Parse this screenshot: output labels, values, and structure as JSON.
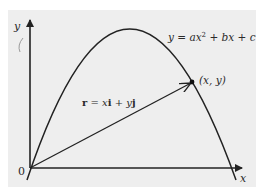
{
  "diagram": {
    "type": "position-vector-on-parabola",
    "background": {
      "panel": "#eeeeee",
      "page": "#ffffff"
    },
    "colors": {
      "stroke": "#222222",
      "text": "#2a2a2a",
      "stray_mark": "#9a9a9a"
    },
    "axes": {
      "x_label": "x",
      "y_label": "y",
      "origin_label": "0"
    },
    "curve": {
      "equation": "y = ax² + bx + c",
      "equation_parts": {
        "lhs": "y",
        "eq": " = ",
        "a": "a",
        "x1": "x",
        "sup": "2",
        "plus1": " + ",
        "b": "b",
        "x2": "x",
        "plus2": " + ",
        "c": "c"
      }
    },
    "point": {
      "label": "(x, y)"
    },
    "vector": {
      "label": "r = xi + yj",
      "label_parts": {
        "r": "r",
        "eq": " = ",
        "x": "x",
        "i": "i",
        "plus": " + ",
        "y": "y",
        "j": "j"
      }
    }
  }
}
